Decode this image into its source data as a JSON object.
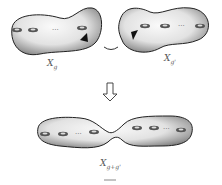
{
  "diagram": {
    "surfaces": [
      {
        "id": "left",
        "label_base": "X",
        "label_sub": "g",
        "handles_left": 2,
        "handles_right": 1,
        "ellipsis": "···"
      },
      {
        "id": "right",
        "label_base": "X",
        "label_sub": "g'",
        "handles_left": 2,
        "handles_right": 1,
        "ellipsis": "···"
      },
      {
        "id": "glued",
        "label_base": "X",
        "label_sub": "g+g'",
        "handles": 6,
        "ellipsis": "···"
      }
    ],
    "arrow": "down-arrow",
    "connector": "curved-connector",
    "colors": {
      "surface_light": "#f4f4f4",
      "surface_dark": "#7a7a7a",
      "outline": "#222222",
      "label": "#555555"
    }
  }
}
